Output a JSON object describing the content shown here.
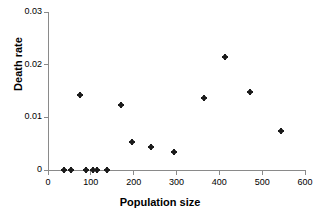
{
  "chart_data": {
    "type": "scatter",
    "title": "",
    "xlabel": "Population size",
    "ylabel": "Death rate",
    "xlim": [
      0,
      600
    ],
    "ylim": [
      0,
      0.03
    ],
    "xticks": [
      0,
      100,
      200,
      300,
      400,
      500,
      600
    ],
    "xtick_labels": [
      "0",
      "100",
      "200",
      "300",
      "400",
      "500",
      "600"
    ],
    "yticks": [
      0,
      0.01,
      0.02,
      0.03
    ],
    "ytick_labels": [
      "0",
      "0.01",
      "0.02",
      "0.03"
    ],
    "grid": false,
    "legend": null,
    "marker": "diamond",
    "marker_color": "#1a1a1a",
    "axis_color": "#8a8a8a",
    "series": [
      {
        "name": "Death rate",
        "points": [
          {
            "x": 37,
            "y": 0
          },
          {
            "x": 54,
            "y": 0
          },
          {
            "x": 75,
            "y": 0.0143
          },
          {
            "x": 89,
            "y": 0
          },
          {
            "x": 105,
            "y": 0
          },
          {
            "x": 115,
            "y": 0
          },
          {
            "x": 138,
            "y": 0
          },
          {
            "x": 171,
            "y": 0.0123
          },
          {
            "x": 196,
            "y": 0.0053
          },
          {
            "x": 241,
            "y": 0.0043
          },
          {
            "x": 294,
            "y": 0.0035
          },
          {
            "x": 364,
            "y": 0.0137
          },
          {
            "x": 414,
            "y": 0.0215
          },
          {
            "x": 472,
            "y": 0.0148
          },
          {
            "x": 544,
            "y": 0.0074
          }
        ]
      }
    ]
  }
}
